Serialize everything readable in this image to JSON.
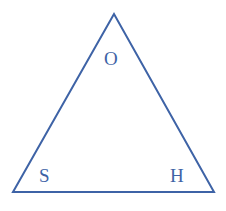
{
  "figure": {
    "kind": "geometry-diagram",
    "shape_name": "triangle",
    "background_color": "#ffffff",
    "stroke_color": "#3e63a6",
    "stroke_width_px": 2,
    "label_color": "#3e63a6",
    "width_px": 226,
    "height_px": 211,
    "vertices": [
      {
        "label": "O",
        "x": 114,
        "y": 14,
        "role": "apex"
      },
      {
        "label": "S",
        "x": 13,
        "y": 192,
        "role": "bottom-left"
      },
      {
        "label": "H",
        "x": 214,
        "y": 192,
        "role": "bottom-right"
      }
    ],
    "labels": {
      "apex": "O",
      "bottom_left": "S",
      "bottom_right": "H"
    },
    "path_points": "114,14 13,192 214,192"
  }
}
